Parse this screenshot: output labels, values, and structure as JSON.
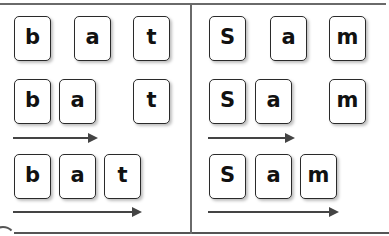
{
  "panels": [
    {
      "word": "bat",
      "rows": [
        {
          "tiles": [
            "b",
            "a",
            "t"
          ]
        },
        {
          "tiles": [
            "b",
            "a",
            "t"
          ]
        },
        {
          "tiles": [
            "b",
            "a",
            "t"
          ]
        }
      ]
    },
    {
      "word": "Sam",
      "rows": [
        {
          "tiles": [
            "S",
            "a",
            "m"
          ]
        },
        {
          "tiles": [
            "S",
            "a",
            "m"
          ]
        },
        {
          "tiles": [
            "S",
            "a",
            "m"
          ]
        }
      ]
    }
  ],
  "colors": {
    "tile_border": "#2a2a2a",
    "arrow": "#444444",
    "frame": "#6a6a6a"
  }
}
